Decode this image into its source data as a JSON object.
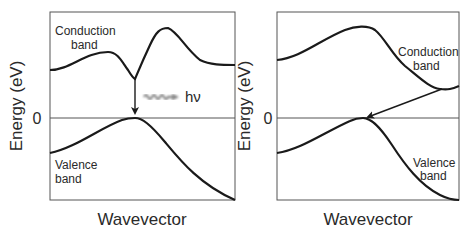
{
  "panels": [
    {
      "id": "direct",
      "ylabel": "Energy (eV)",
      "xlabel": "Wavevector",
      "zero_tick": "0",
      "conduction_label": [
        "Conduction",
        "band"
      ],
      "valence_label": [
        "Valence",
        "band"
      ],
      "photon_label": "hν"
    },
    {
      "id": "indirect",
      "ylabel": "Energy (eV)",
      "xlabel": "Wavevector",
      "zero_tick": "0",
      "conduction_label": [
        "Conduction",
        "band"
      ],
      "valence_label": [
        "Valence",
        "band"
      ]
    }
  ],
  "colors": {
    "curve": "#1a1a1a",
    "frame": "#555555",
    "photon": "#888888"
  }
}
